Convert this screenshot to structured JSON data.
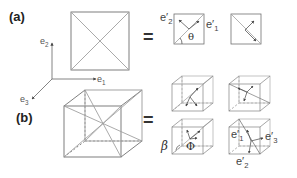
{
  "panels": {
    "a": {
      "label": "(a)"
    },
    "b": {
      "label": "(b)"
    }
  },
  "axes": {
    "e1": "e",
    "e1_sub": "1",
    "e2": "e",
    "e2_sub": "2",
    "e3": "e",
    "e3_sub": "3"
  },
  "equals": "=",
  "panel_a_labels": {
    "e_prime_2": "e′",
    "e_prime_2_sub": "2",
    "e_prime_1": "e′",
    "e_prime_1_sub": "1",
    "theta": "θ"
  },
  "panel_b_labels": {
    "beta": "β",
    "phi": "Φ",
    "e_prime_1": "e′",
    "e_prime_1_sub": "1",
    "e_prime_2": "e′",
    "e_prime_2_sub": "2",
    "e_prime_3": "e′",
    "e_prime_3_sub": "3"
  },
  "colors": {
    "line": "#707070",
    "light_line": "#a0a0a0",
    "text": "#333333"
  }
}
